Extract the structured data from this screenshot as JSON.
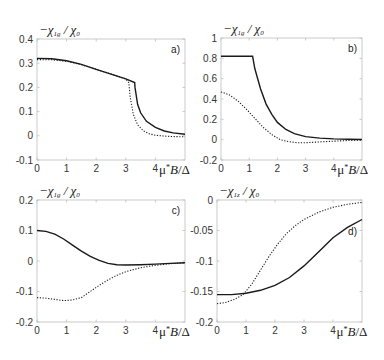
{
  "chart_data": [
    {
      "type": "line",
      "panel": "a)",
      "ylabel": "−χ_{1g}/χ_0",
      "xlabel": "μ*B/Δ",
      "xlim": [
        0,
        5
      ],
      "ylim": [
        -0.1,
        0.4
      ],
      "xticks": [
        "0",
        "1",
        "2",
        "3",
        "4"
      ],
      "yticks": [
        "-0.1",
        "0",
        "0.1",
        "0.2",
        "0.3",
        "0.4"
      ],
      "box": {
        "left": 37,
        "top": 39,
        "right": 185,
        "bottom": 160
      },
      "series": [
        {
          "name": "solid",
          "style": "solid",
          "x": [
            0,
            0.5,
            1.0,
            1.5,
            2.0,
            2.5,
            3.0,
            3.3,
            3.31,
            3.4,
            3.5,
            3.7,
            4.0,
            4.3,
            4.6,
            5.0
          ],
          "y": [
            0.32,
            0.318,
            0.31,
            0.295,
            0.275,
            0.255,
            0.235,
            0.22,
            0.2,
            0.13,
            0.095,
            0.06,
            0.035,
            0.02,
            0.012,
            0.006
          ]
        },
        {
          "name": "dotted",
          "style": "dotted",
          "x": [
            0,
            0.5,
            1.0,
            1.5,
            2.0,
            2.5,
            3.0,
            3.1,
            3.15,
            3.25,
            3.4,
            3.6,
            3.8,
            4.0,
            4.5,
            5.0
          ],
          "y": [
            0.315,
            0.314,
            0.308,
            0.294,
            0.275,
            0.255,
            0.235,
            0.22,
            0.16,
            0.09,
            0.045,
            0.02,
            0.008,
            0.002,
            -0.003,
            -0.004
          ]
        }
      ]
    },
    {
      "type": "line",
      "panel": "b)",
      "ylabel": "−χ_{1g}/χ_0",
      "xlabel": "μ*B/Δ",
      "xlim": [
        0,
        5
      ],
      "ylim": [
        -0.2,
        1.0
      ],
      "xticks": [
        "0",
        "1",
        "2",
        "3",
        "4"
      ],
      "yticks": [
        "-0.2",
        "0",
        "0.2",
        "0.4",
        "0.6",
        "0.8",
        "1"
      ],
      "box": {
        "left": 221,
        "top": 38,
        "right": 362,
        "bottom": 160
      },
      "series": [
        {
          "name": "solid",
          "style": "solid",
          "x": [
            0,
            0.5,
            1.0,
            1.12,
            1.2,
            1.4,
            1.6,
            1.8,
            2.0,
            2.3,
            2.6,
            3.0,
            3.5,
            4.0,
            4.5,
            5.0
          ],
          "y": [
            0.82,
            0.82,
            0.82,
            0.82,
            0.7,
            0.5,
            0.35,
            0.25,
            0.17,
            0.1,
            0.06,
            0.03,
            0.015,
            0.008,
            0.004,
            0.002
          ]
        },
        {
          "name": "dotted",
          "style": "dotted",
          "x": [
            0,
            0.3,
            0.6,
            0.9,
            1.2,
            1.5,
            1.8,
            2.1,
            2.4,
            2.7,
            3.0,
            3.5,
            4.0,
            4.5,
            5.0
          ],
          "y": [
            0.47,
            0.44,
            0.38,
            0.3,
            0.21,
            0.12,
            0.05,
            0.0,
            -0.02,
            -0.03,
            -0.03,
            -0.022,
            -0.015,
            -0.008,
            -0.004
          ]
        }
      ]
    },
    {
      "type": "line",
      "panel": "c)",
      "ylabel": "−χ_{1g}/χ_0",
      "xlabel": "μ*B/Δ",
      "xlim": [
        0,
        5
      ],
      "ylim": [
        -0.2,
        0.2
      ],
      "xticks": [
        "0",
        "1",
        "2",
        "3",
        "4"
      ],
      "yticks": [
        "-0.2",
        "-0.1",
        "0",
        "0.1",
        "0.2"
      ],
      "box": {
        "left": 37,
        "top": 200,
        "right": 185,
        "bottom": 322
      },
      "series": [
        {
          "name": "solid",
          "style": "solid",
          "x": [
            0,
            0.3,
            0.6,
            0.9,
            1.2,
            1.5,
            1.8,
            2.1,
            2.4,
            2.7,
            3.0,
            3.5,
            4.0,
            4.5,
            5.0
          ],
          "y": [
            0.1,
            0.097,
            0.088,
            0.072,
            0.052,
            0.032,
            0.015,
            0.002,
            -0.008,
            -0.012,
            -0.013,
            -0.012,
            -0.01,
            -0.008,
            -0.006
          ]
        },
        {
          "name": "dotted",
          "style": "dotted",
          "x": [
            0,
            0.3,
            0.6,
            0.9,
            1.2,
            1.5,
            1.8,
            2.1,
            2.4,
            2.7,
            3.0,
            3.5,
            4.0,
            4.5,
            5.0
          ],
          "y": [
            -0.12,
            -0.122,
            -0.126,
            -0.13,
            -0.128,
            -0.12,
            -0.1,
            -0.08,
            -0.062,
            -0.047,
            -0.035,
            -0.022,
            -0.014,
            -0.009,
            -0.006
          ]
        }
      ]
    },
    {
      "type": "line",
      "panel": "d)",
      "ylabel": "−χ_{1z}/χ_0",
      "xlabel": "μ*B/Δ",
      "xlim": [
        0,
        5
      ],
      "ylim": [
        -0.2,
        0
      ],
      "xticks": [
        "0",
        "1",
        "2",
        "3",
        "4"
      ],
      "yticks": [
        "-0.2",
        "-0.15",
        "-0.1",
        "-0.05",
        "0"
      ],
      "box": {
        "left": 217,
        "top": 200,
        "right": 362,
        "bottom": 322
      },
      "series": [
        {
          "name": "solid",
          "style": "solid",
          "x": [
            0,
            0.5,
            1.0,
            1.5,
            2.0,
            2.5,
            3.0,
            3.5,
            4.0,
            4.5,
            5.0
          ],
          "y": [
            -0.155,
            -0.155,
            -0.153,
            -0.148,
            -0.14,
            -0.127,
            -0.108,
            -0.085,
            -0.062,
            -0.045,
            -0.032
          ]
        },
        {
          "name": "dotted",
          "style": "dotted",
          "x": [
            0,
            0.3,
            0.6,
            0.9,
            1.2,
            1.5,
            1.8,
            2.1,
            2.4,
            2.7,
            3.0,
            3.5,
            4.0,
            4.5,
            5.0
          ],
          "y": [
            -0.17,
            -0.168,
            -0.163,
            -0.155,
            -0.138,
            -0.115,
            -0.092,
            -0.072,
            -0.055,
            -0.042,
            -0.032,
            -0.02,
            -0.012,
            -0.007,
            -0.004
          ]
        }
      ]
    }
  ]
}
